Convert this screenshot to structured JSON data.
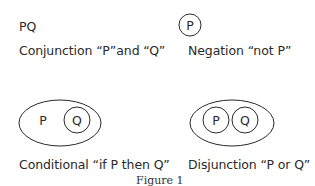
{
  "figure": {
    "caption": "Figure 1",
    "panels": [
      {
        "id": "conjunction",
        "symbol_text": "PQ",
        "label": "Conjunction “P”and “Q”"
      },
      {
        "id": "negation",
        "symbol_text": "P",
        "label": "Negation “not P”"
      },
      {
        "id": "conditional",
        "outer_text": "P",
        "inner_text": "Q",
        "label": "Conditional “if P then Q”"
      },
      {
        "id": "disjunction",
        "left_text": "P",
        "right_text": "Q",
        "label": "Disjunction “P or Q”"
      }
    ],
    "stroke_color": "#2a2a2a",
    "background": "#ffffff"
  }
}
